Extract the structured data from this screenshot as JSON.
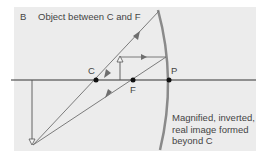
{
  "panel": {
    "letter": "B",
    "title": "Object between C and F"
  },
  "points": {
    "c": "C",
    "f": "F",
    "p": "P"
  },
  "caption": {
    "lines": [
      "Magnified, inverted,",
      "real image formed",
      "beyond C"
    ]
  },
  "colors": {
    "background": "#ececec",
    "ray": "#6e6e6e",
    "axis": "#333333",
    "mirror": "#8a8a8a",
    "point": "#111111"
  },
  "icons": {
    "mirror": "concave-mirror-arc",
    "object": "upright-object-arrow",
    "image": "inverted-image-arrow",
    "points": "focal-point-dot"
  }
}
